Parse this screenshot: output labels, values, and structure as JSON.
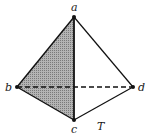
{
  "diagram": {
    "figure_label": "T",
    "vertices": [
      {
        "id": "a",
        "label": "a",
        "x": 74,
        "y": 17
      },
      {
        "id": "b",
        "label": "b",
        "x": 17,
        "y": 87
      },
      {
        "id": "c",
        "label": "c",
        "x": 74,
        "y": 120
      },
      {
        "id": "d",
        "label": "d",
        "x": 133,
        "y": 87
      }
    ],
    "edges": [
      {
        "from": "a",
        "to": "b",
        "style": "solid"
      },
      {
        "from": "a",
        "to": "c",
        "style": "solid"
      },
      {
        "from": "a",
        "to": "d",
        "style": "solid"
      },
      {
        "from": "b",
        "to": "c",
        "style": "solid"
      },
      {
        "from": "c",
        "to": "d",
        "style": "solid"
      },
      {
        "from": "b",
        "to": "d",
        "style": "dashed"
      }
    ],
    "shaded_face": [
      "a",
      "b",
      "c"
    ],
    "colors": {
      "line": "#111111",
      "shade": "#9a9a9a",
      "background": "#ffffff"
    }
  }
}
